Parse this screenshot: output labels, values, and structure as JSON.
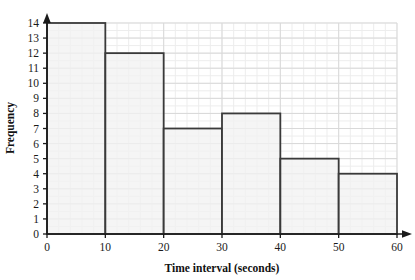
{
  "chart_data": {
    "type": "bar",
    "title": "",
    "xlabel": "Time interval (seconds)",
    "ylabel": "Frequency",
    "categories": [
      "0-10",
      "10-20",
      "20-30",
      "30-40",
      "40-50",
      "50-60"
    ],
    "bin_edges": [
      0,
      10,
      20,
      30,
      40,
      50,
      60
    ],
    "values": [
      14,
      12,
      7,
      8,
      5,
      4
    ],
    "xlim": [
      0,
      60
    ],
    "ylim": [
      0,
      14
    ],
    "xticks": [
      0,
      10,
      20,
      30,
      40,
      50,
      60
    ],
    "yticks": [
      0,
      1,
      2,
      3,
      4,
      5,
      6,
      7,
      8,
      9,
      10,
      11,
      12,
      13,
      14
    ],
    "xtick_labels": [
      "0",
      "10",
      "20",
      "30",
      "40",
      "50",
      "60"
    ],
    "ytick_labels": [
      "0",
      "1",
      "2",
      "3",
      "4",
      "5",
      "6",
      "7",
      "8",
      "9",
      "10",
      "11",
      "12",
      "13",
      "14"
    ],
    "grid": true,
    "minor_grid": true,
    "legend": false,
    "bar_fill_color": "#f2f2f2",
    "bar_edge_color": "#3a3a3a",
    "grid_major_color": "#d9d9d9",
    "grid_minor_color": "#ededed",
    "axis_color": "#1a1a1a"
  },
  "axes": {
    "x_title": "Time interval (seconds)",
    "y_title": "Frequency"
  }
}
